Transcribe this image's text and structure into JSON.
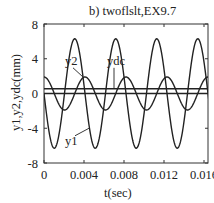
{
  "chart_data": {
    "type": "line",
    "title": "b) twoflslt,EX9.7",
    "xlabel": "t(sec)",
    "ylabel": "y1,y2,ydc(mm)",
    "xlim": [
      0,
      0.0165
    ],
    "ylim": [
      -8,
      8
    ],
    "xticks": [
      0,
      0.004,
      0.008,
      0.012,
      0.016
    ],
    "xtick_labels": [
      "0",
      "0.004",
      "0.008",
      "0.012",
      "0.016"
    ],
    "yticks": [
      8,
      4,
      0,
      -4,
      -8
    ],
    "ytick_labels": [
      "8",
      "4",
      "0",
      "-4",
      "-8"
    ],
    "grid": false,
    "legend": "none (inline labels with leader lines)",
    "series": [
      {
        "name": "y1",
        "description": "sinusoid, amplitude ~6.3 mm, period ~0.0041 s, starts at 0 going negative",
        "amplitude": 6.3,
        "period": 0.0041,
        "offset": 0,
        "form": "-A*sin(2*pi*t/T)",
        "x": [
          0,
          0.0005,
          0.001,
          0.0015,
          0.002,
          0.0025,
          0.003,
          0.0035,
          0.004,
          0.0045,
          0.005,
          0.0055,
          0.006,
          0.0065,
          0.007,
          0.0075,
          0.008,
          0.0085,
          0.009,
          0.0095,
          0.01,
          0.0105,
          0.011,
          0.0115,
          0.012,
          0.0125,
          0.013,
          0.0135,
          0.014,
          0.0145,
          0.015,
          0.0155,
          0.016,
          0.0165
        ],
        "values": [
          0,
          -4.4,
          -6.3,
          -4.7,
          -0.3,
          4.2,
          6.3,
          4.9,
          0.6,
          -3.9,
          -6.2,
          -5.1,
          -1.0,
          3.6,
          6.2,
          5.3,
          1.4,
          -3.3,
          -6.1,
          -5.6,
          -1.8,
          3.0,
          6.0,
          5.8,
          2.1,
          -2.6,
          -5.8,
          -5.9,
          -2.5,
          2.3,
          5.7,
          6.1,
          2.9,
          -2.0
        ]
      },
      {
        "name": "y2",
        "description": "sinusoid, amplitude ~1.9 mm, period ~0.0041 s, starts at +1.9 (cosine)",
        "amplitude": 1.9,
        "period": 0.0041,
        "offset": 0,
        "form": "A*cos(2*pi*t/T)",
        "x": [
          0,
          0.0005,
          0.001,
          0.0015,
          0.002,
          0.0025,
          0.003,
          0.0035,
          0.004,
          0.0045,
          0.005,
          0.0055,
          0.006,
          0.0065,
          0.007,
          0.0075,
          0.008,
          0.0085,
          0.009,
          0.0095,
          0.01,
          0.0105,
          0.011,
          0.0115,
          0.012,
          0.0125,
          0.013,
          0.0135,
          0.014,
          0.0145,
          0.015,
          0.0155,
          0.016,
          0.0165
        ],
        "values": [
          1.9,
          1.36,
          0.05,
          -1.27,
          -1.9,
          -1.44,
          -0.21,
          1.17,
          1.89,
          1.52,
          0.36,
          -1.06,
          -1.87,
          -1.59,
          -0.51,
          0.95,
          1.85,
          1.66,
          0.66,
          -0.83,
          -1.82,
          -1.72,
          -0.81,
          0.7,
          1.78,
          1.77,
          0.95,
          -0.57,
          -1.73,
          -1.81,
          -1.09,
          0.43,
          1.67,
          1.85
        ]
      },
      {
        "name": "ydc",
        "description": "constant DC offset line",
        "x": [
          0,
          0.0165
        ],
        "values": [
          0.55,
          0.55
        ]
      },
      {
        "name": "zero",
        "description": "zero reference line",
        "x": [
          0,
          0.0165
        ],
        "values": [
          0,
          0
        ]
      }
    ],
    "annotations": [
      {
        "text": "y2",
        "label_at": [
          0.0021,
          3.3
        ],
        "points_to": [
          0.0039,
          1.9
        ]
      },
      {
        "text": "ydc",
        "label_at": [
          0.0063,
          3.3
        ],
        "points_to": [
          0.007,
          0.55
        ]
      },
      {
        "text": "y1",
        "label_at": [
          0.0021,
          -5.9
        ],
        "points_to": [
          0.0045,
          -4.0
        ]
      }
    ]
  },
  "labels": {
    "title": "b) twoflslt,EX9.7",
    "xlabel": "t(sec)",
    "ylabel": "y1,y2,ydc(mm)"
  }
}
